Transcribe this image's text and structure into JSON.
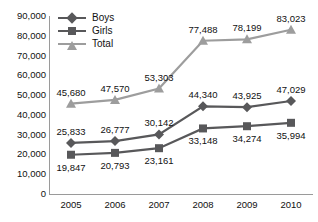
{
  "chart_data": {
    "type": "line",
    "title": "",
    "subtitle": "",
    "xlabel": "",
    "ylabel": "",
    "categories": [
      "2005",
      "2006",
      "2007",
      "2008",
      "2009",
      "2010"
    ],
    "ylim": [
      0,
      90000
    ],
    "ytick_step": 10000,
    "yticks": [
      "90,000",
      "80,000",
      "70,000",
      "60,000",
      "50,000",
      "40,000",
      "30,000",
      "20,000",
      "10,000",
      "0"
    ],
    "ytick_values": [
      90000,
      80000,
      70000,
      60000,
      50000,
      40000,
      30000,
      20000,
      10000,
      0
    ],
    "grid": false,
    "legend_position": "top-left",
    "series": [
      {
        "name": "Boys",
        "marker": "diamond",
        "color": "#58585a",
        "values": [
          25833,
          26777,
          30142,
          44340,
          43925,
          47029
        ],
        "labels": [
          "25,833",
          "26,777",
          "30,142",
          "44,340",
          "43,925",
          "47,029"
        ],
        "label_position": "above"
      },
      {
        "name": "Girls",
        "marker": "square",
        "color": "#58585a",
        "values": [
          19847,
          20793,
          23161,
          33148,
          34274,
          35994
        ],
        "labels": [
          "19,847",
          "20,793",
          "23,161",
          "33,148",
          "34,274",
          "35,994"
        ],
        "label_position": "below"
      },
      {
        "name": "Total",
        "marker": "triangle",
        "color": "#9d9d9d",
        "values": [
          45680,
          47570,
          53303,
          77488,
          78199,
          83023
        ],
        "labels": [
          "45,680",
          "47,570",
          "53,303",
          "77,488",
          "78,199",
          "83,023"
        ],
        "label_position": "above"
      }
    ]
  },
  "legend": {
    "items": [
      {
        "label": "Boys"
      },
      {
        "label": "Girls"
      },
      {
        "label": "Total"
      }
    ]
  },
  "colors": {
    "axis": "#9a9a9a",
    "text": "#111111",
    "series_dark": "#58585a",
    "series_light": "#9d9d9d",
    "background": "#ffffff"
  }
}
